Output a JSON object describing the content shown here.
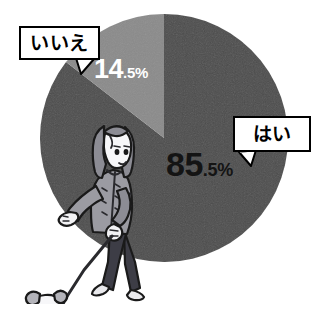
{
  "chart_data": {
    "type": "pie",
    "title": "",
    "categories": [
      "はい",
      "いいえ"
    ],
    "values": [
      85.5,
      14.5
    ],
    "units": "%",
    "labels": [
      "85.5%",
      "14.5%"
    ],
    "legend_position": "callout",
    "grid": false,
    "slices": [
      {
        "name": "はい",
        "value": 85.5,
        "value_main": "85",
        "value_decimal": ".5%",
        "color": "#4d4d4d",
        "label_color": "#141414",
        "callout": "はい"
      },
      {
        "name": "いいえ",
        "value": 14.5,
        "value_main": "14",
        "value_decimal": ".5%",
        "color": "#8b8b8b",
        "label_color": "#ffffff",
        "callout": "いいえ"
      }
    ]
  },
  "callouts": {
    "no": {
      "label": "いいえ"
    },
    "yes": {
      "label": "はい"
    }
  },
  "percent_labels": {
    "no": {
      "main": "14",
      "decimal": ".5%"
    },
    "yes": {
      "main": "85",
      "decimal": ".5%"
    }
  },
  "illustration": {
    "name": "woman-walking-dog",
    "description": "犬の散歩"
  },
  "colors": {
    "background": "#ffffff",
    "slice_yes": "#4d4d4d",
    "slice_no": "#8b8b8b",
    "outline": "#000000",
    "label_light": "#ffffff",
    "label_dark": "#141414"
  }
}
